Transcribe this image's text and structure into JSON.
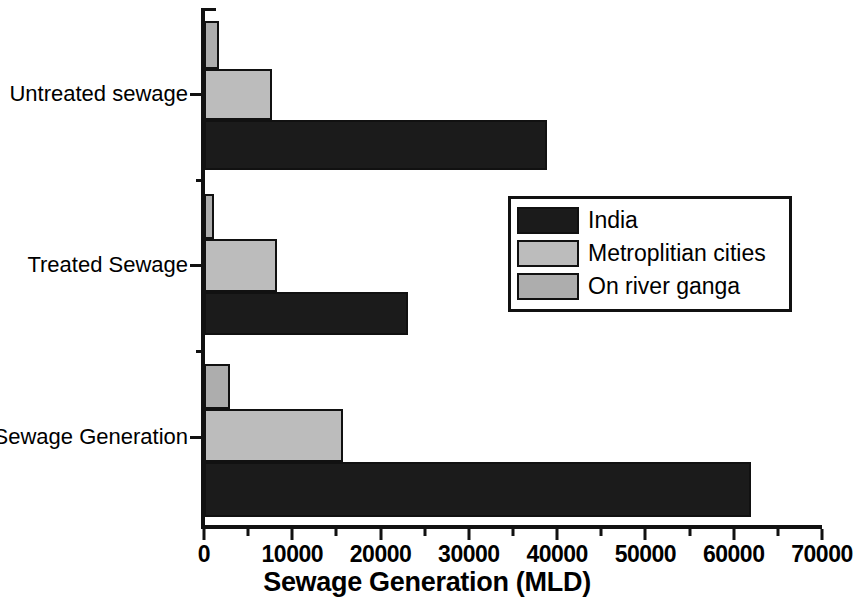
{
  "chart_data": {
    "type": "bar",
    "orientation": "horizontal",
    "title": "",
    "xlabel": "Sewage Generation (MLD)",
    "ylabel": "",
    "categories": [
      "Sewage Generation",
      "Treated Sewage",
      "Untreated sewage"
    ],
    "series": [
      {
        "name": "India",
        "color": "#1b1b1b",
        "values": [
          62000,
          23100,
          38800
        ]
      },
      {
        "name": "Metroplitian cities",
        "color": "#bcbcbc",
        "values": [
          15700,
          8300,
          7700
        ]
      },
      {
        "name": "On river ganga",
        "color": "#adadad",
        "values": [
          2900,
          1100,
          1700
        ]
      }
    ],
    "xlim": [
      0,
      70000
    ],
    "xticks": [
      0,
      10000,
      20000,
      30000,
      40000,
      50000,
      60000,
      70000
    ],
    "xtick_labels": [
      "0",
      "10000",
      "20000",
      "30000",
      "40000",
      "50000",
      "60000",
      "70000"
    ],
    "xtick_minor_step": 5000,
    "grid": false,
    "legend_position": "center-right",
    "legend_entries": [
      "India",
      "Metroplitian cities",
      "On river ganga"
    ]
  },
  "axis": {
    "x_title": "Sewage Generation (MLD)",
    "tick_labels": [
      "0",
      "10000",
      "20000",
      "30000",
      "40000",
      "50000",
      "60000",
      "70000"
    ],
    "category_labels": [
      "Untreated sewage",
      "Treated Sewage",
      "Sewage Generation"
    ]
  },
  "legend": {
    "items": [
      {
        "label": "India",
        "color": "#1b1b1b"
      },
      {
        "label": "Metroplitian cities",
        "color": "#bcbcbc"
      },
      {
        "label": "On river ganga",
        "color": "#adadad"
      }
    ]
  },
  "colors": {
    "axis": "#111111",
    "background": "#ffffff",
    "india": "#1b1b1b",
    "metro": "#bcbcbc",
    "ganga": "#adadad"
  }
}
